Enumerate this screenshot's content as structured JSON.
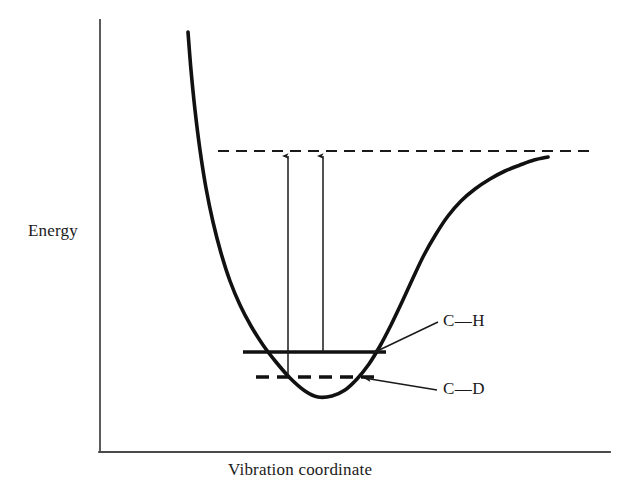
{
  "figure": {
    "background_color": "#ffffff",
    "ink_color": "#1a1a1a"
  },
  "axes": {
    "y_label": "Energy",
    "x_label": "Vibration coordinate",
    "origin": {
      "x": 100,
      "y": 452
    },
    "y_axis_top": {
      "x": 100,
      "y": 20
    },
    "x_axis_right": {
      "x": 610,
      "y": 452
    },
    "ticks": [],
    "tick_labels": []
  },
  "levels": [
    {
      "id": "ch",
      "label": "C—H",
      "style": "solid",
      "y": 352,
      "x_start": 243,
      "x_end": 386,
      "label_x": 443,
      "label_y": 311,
      "leader_from": {
        "x": 438,
        "y": 322
      },
      "leader_to": {
        "x": 371,
        "y": 354
      }
    },
    {
      "id": "cd",
      "label": "C—D",
      "style": "dashed",
      "y": 377,
      "x_start": 256,
      "x_end": 381,
      "label_x": 443,
      "label_y": 379,
      "leader_from": {
        "x": 437,
        "y": 390
      },
      "leader_to": {
        "x": 362,
        "y": 378
      }
    }
  ],
  "dissociation_line": {
    "label": "dissociation-asymptote",
    "style": "dashed",
    "y": 151,
    "x_start": 218,
    "x_end": 590
  },
  "arrows": [
    {
      "id": "cd-dissociation-arrow",
      "from_level": "cd",
      "x": 288,
      "y_bottom": 377,
      "y_top": 154
    },
    {
      "id": "ch-dissociation-arrow",
      "from_level": "ch",
      "x": 323,
      "y_bottom": 352,
      "y_top": 154
    }
  ],
  "chart_data": {
    "type": "line",
    "xlabel": "Vibration coordinate",
    "ylabel": "Energy",
    "grid": false,
    "legend": "none",
    "axis_ticks": false,
    "xlim": [
      100,
      610
    ],
    "ylim": [
      20,
      452
    ],
    "series": [
      {
        "name": "Morse potential energy curve",
        "style": "solid",
        "points": [
          [
            188,
            32
          ],
          [
            191,
            70
          ],
          [
            195,
            110
          ],
          [
            200,
            150
          ],
          [
            206,
            188
          ],
          [
            213,
            222
          ],
          [
            221,
            253
          ],
          [
            230,
            281
          ],
          [
            240,
            305
          ],
          [
            251,
            326
          ],
          [
            263,
            345
          ],
          [
            276,
            362
          ],
          [
            290,
            378
          ],
          [
            305,
            391
          ],
          [
            318,
            397
          ],
          [
            332,
            396
          ],
          [
            345,
            390
          ],
          [
            357,
            379
          ],
          [
            369,
            364
          ],
          [
            380,
            346
          ],
          [
            391,
            325
          ],
          [
            402,
            302
          ],
          [
            413,
            278
          ],
          [
            424,
            255
          ],
          [
            436,
            234
          ],
          [
            448,
            216
          ],
          [
            461,
            201
          ],
          [
            475,
            189
          ],
          [
            490,
            179
          ],
          [
            505,
            171
          ],
          [
            520,
            165
          ],
          [
            534,
            160
          ],
          [
            548,
            157
          ]
        ]
      },
      {
        "name": "Dissociation asymptote",
        "style": "dashed",
        "points": [
          [
            218,
            151
          ],
          [
            590,
            151
          ]
        ]
      },
      {
        "name": "C—H zero-point level",
        "style": "solid",
        "points": [
          [
            243,
            352
          ],
          [
            386,
            352
          ]
        ]
      },
      {
        "name": "C—D zero-point level",
        "style": "dashed",
        "points": [
          [
            256,
            377
          ],
          [
            381,
            377
          ]
        ]
      }
    ],
    "annotations": [
      {
        "text": "Energy",
        "x": 28,
        "y": 230,
        "role": "y-axis-label"
      },
      {
        "text": "Vibration coordinate",
        "x": 228,
        "y": 470,
        "role": "x-axis-label"
      },
      {
        "text": "C—H",
        "x": 443,
        "y": 322,
        "role": "level-label"
      },
      {
        "text": "C—D",
        "x": 443,
        "y": 390,
        "role": "level-label"
      }
    ]
  }
}
